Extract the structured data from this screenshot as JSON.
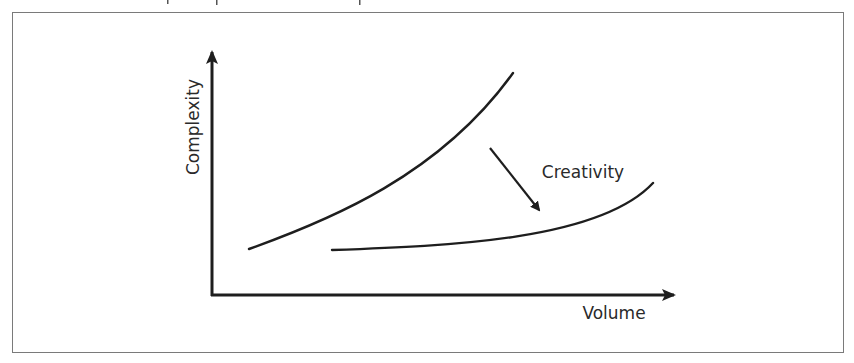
{
  "figure": {
    "frame_color": "#7a7a7a",
    "stroke_color": "#1e1e1e",
    "axes": {
      "y_label": "Complexity",
      "x_label": "Volume",
      "origin": [
        212,
        295
      ],
      "y_arrow_tip": [
        212,
        50
      ],
      "x_arrow_tip": [
        676,
        295
      ]
    },
    "curves": [
      {
        "name": "upper-curve",
        "path": "M249,249 C330,220 440,175 513,73"
      },
      {
        "name": "lower-curve",
        "path": "M332,250 C450,246 600,240 653,183"
      }
    ],
    "annotation": {
      "label": "Creativity",
      "arrow_from": [
        490,
        148
      ],
      "arrow_to": [
        541,
        212
      ]
    }
  }
}
